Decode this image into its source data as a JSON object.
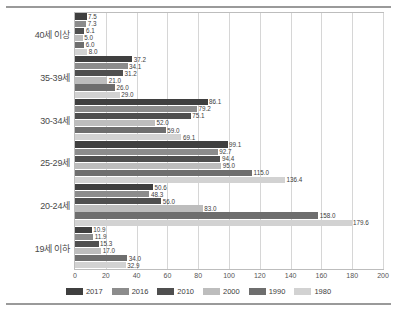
{
  "chart_data": {
    "type": "bar",
    "orientation": "horizontal",
    "title": "",
    "xlabel": "",
    "ylabel": "",
    "xlim": [
      0,
      200
    ],
    "xticks": [
      "0",
      "20",
      "40",
      "60",
      "80",
      "100",
      "120",
      "140",
      "160",
      "180",
      "200"
    ],
    "grid": true,
    "legend_position": "bottom",
    "categories": [
      "40세 이상",
      "35-39세",
      "30-34세",
      "25-29세",
      "20-24세",
      "19세 이하"
    ],
    "series": [
      {
        "name": "2017",
        "color": "#3f3f3f",
        "values": [
          7.5,
          37.2,
          86.1,
          99.1,
          50.6,
          10.9
        ]
      },
      {
        "name": "2016",
        "color": "#8c8c8c",
        "values": [
          7.3,
          34.1,
          79.2,
          92.7,
          48.3,
          11.9
        ]
      },
      {
        "name": "2010",
        "color": "#4f4f4f",
        "values": [
          6.1,
          31.2,
          75.1,
          94.4,
          56.0,
          15.3
        ]
      },
      {
        "name": "2000",
        "color": "#bdbdbd",
        "values": [
          5.0,
          21.0,
          52.0,
          95.0,
          83.0,
          17.0
        ]
      },
      {
        "name": "1990",
        "color": "#6e6e6e",
        "values": [
          6.0,
          26.0,
          59.0,
          115.0,
          158.0,
          34.0
        ]
      },
      {
        "name": "1980",
        "color": "#d2d2d2",
        "values": [
          8.0,
          29.0,
          69.1,
          136.4,
          179.6,
          32.9
        ]
      }
    ],
    "value_labels": [
      [
        "7.5",
        "7.3",
        "6.1",
        "5.0",
        "6.0",
        "8.0"
      ],
      [
        "37.2",
        "34.1",
        "31.2",
        "21.0",
        "26.0",
        "29.0"
      ],
      [
        "86.1",
        "79.2",
        "75.1",
        "52.0",
        "59.0",
        "69.1"
      ],
      [
        "99.1",
        "92.7",
        "94.4",
        "95.0",
        "115.0",
        "136.4"
      ],
      [
        "50.6",
        "48.3",
        "56.0",
        "83.0",
        "158.0",
        "179.6"
      ],
      [
        "10.9",
        "11.9",
        "15.3",
        "17.0",
        "34.0",
        "32.9"
      ]
    ]
  },
  "footnote": ""
}
